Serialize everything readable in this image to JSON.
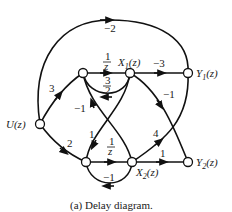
{
  "diagram": {
    "title": "Delay diagram",
    "caption": "(a)  Delay diagram.",
    "nodes": {
      "U": "U(z)",
      "X1": "X",
      "X1_sub": "1",
      "X1_arg": "(z)",
      "X2": "X",
      "X2_sub": "2",
      "X2_arg": "(z)",
      "Y1": "Y",
      "Y1_sub": "1",
      "Y1_arg": "(z)",
      "Y2": "Y",
      "Y2_sub": "2",
      "Y2_arg": "(z)"
    },
    "gains": {
      "u_to_n1": "3",
      "u_to_n2": "2",
      "u_to_y1": "−2",
      "n1_to_x1_num": "1",
      "n1_to_x1_den": "z",
      "x1_to_n1_num": "3",
      "x1_to_n1_den": "2",
      "x1_to_y1": "−3",
      "x1_to_y2": "−1",
      "x2_to_n1": "−1",
      "x1_to_n2": "1",
      "n2_to_x2_num": "1",
      "n2_to_x2_den": "z",
      "x2_to_n2": "−1",
      "x2_to_y1": "4",
      "x2_to_y2": "1"
    },
    "edges": [
      {
        "from": "U",
        "to": "N1",
        "gain": "3"
      },
      {
        "from": "U",
        "to": "N2",
        "gain": "2"
      },
      {
        "from": "U",
        "to": "Y1",
        "gain": "-2"
      },
      {
        "from": "N1",
        "to": "X1",
        "gain": "1/z"
      },
      {
        "from": "X1",
        "to": "N1",
        "gain": "3/2"
      },
      {
        "from": "X1",
        "to": "Y1",
        "gain": "-3"
      },
      {
        "from": "X1",
        "to": "Y2",
        "gain": "-1"
      },
      {
        "from": "X1",
        "to": "N2",
        "gain": "1"
      },
      {
        "from": "X2",
        "to": "N1",
        "gain": "-1"
      },
      {
        "from": "N2",
        "to": "X2",
        "gain": "1/z"
      },
      {
        "from": "X2",
        "to": "N2",
        "gain": "-1"
      },
      {
        "from": "X2",
        "to": "Y1",
        "gain": "4"
      },
      {
        "from": "X2",
        "to": "Y2",
        "gain": "1"
      }
    ]
  }
}
